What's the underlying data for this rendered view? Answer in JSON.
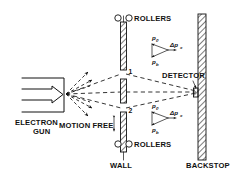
{
  "figure": {
    "background_color": "#ffffff",
    "ink_color": "#111111"
  },
  "labels": {
    "electron_gun_line1": "ELECTRON",
    "electron_gun_line2": "GUN",
    "rollers_top": "ROLLERS",
    "rollers_bottom": "ROLLERS",
    "wall": "WALL",
    "backstop": "BACKSTOP",
    "detector": "DETECTOR",
    "motion_free": "MOTION FREE",
    "slit_1": "1",
    "slit_2": "2"
  },
  "vectors": {
    "upper": {
      "p0_symbol": "p",
      "p0_subscript": "0",
      "pb_symbol": "p",
      "pb_subscript": "b",
      "delta_symbol": "Δp",
      "delta_subscript": "x"
    },
    "lower": {
      "p0_symbol": "p",
      "p0_subscript": "0",
      "pb_symbol": "p",
      "pb_subscript": "b",
      "delta_symbol": "Δp",
      "delta_subscript": "x"
    }
  },
  "icons": {
    "roller_top_left": "roller-circle-icon",
    "roller_top_right": "roller-circle-icon",
    "roller_bottom_left": "roller-circle-icon",
    "roller_bottom_right": "roller-circle-icon",
    "motion_arrow": "double-headed-vertical-arrow-icon",
    "detector_pointer": "arrow-pointer-icon"
  }
}
